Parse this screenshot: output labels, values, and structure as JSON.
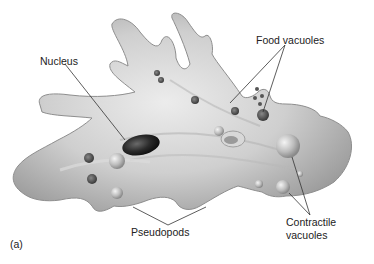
{
  "figure": {
    "panel_label": "(a)",
    "colors": {
      "background": "#ffffff",
      "body_fill": "#c8c8c8",
      "body_highlight": "#e8e8e8",
      "body_shadow": "#8a8a8a",
      "nucleus": "#2a2a2a",
      "leader_line": "#333333",
      "text": "#222222"
    }
  },
  "labels": {
    "nucleus": "Nucleus",
    "food_vacuoles": "Food vacuoles",
    "pseudopods": "Pseudopods",
    "contractile_vacuoles_line1": "Contractile",
    "contractile_vacuoles_line2": "vacuoles"
  }
}
